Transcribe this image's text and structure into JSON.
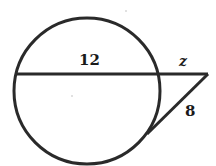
{
  "diagram": {
    "type": "circle-secant-tangent",
    "circle": {
      "cx": 87,
      "cy": 91,
      "r": 73
    },
    "secant": {
      "x1": 15,
      "y1": 74,
      "x2": 208,
      "y2": 74
    },
    "tangent": {
      "x1": 208,
      "y1": 74,
      "x2": 147,
      "y2": 134
    },
    "stroke_color": "#2a2a2a",
    "labels": {
      "chord": "12",
      "external_secant": "z",
      "tangent": "8"
    }
  }
}
